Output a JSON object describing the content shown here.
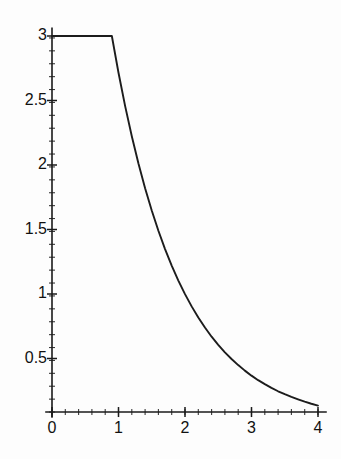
{
  "chart_data": {
    "type": "line",
    "title": "",
    "subtitle": "",
    "xlabel": "",
    "ylabel": "",
    "xlim": [
      -0.05,
      4.12
    ],
    "ylim": [
      0,
      3.12
    ],
    "grid": false,
    "legend": null,
    "annotations": [],
    "axis": {
      "x_ticks": [
        0,
        1,
        2,
        3,
        4
      ],
      "x_tick_labels": [
        "0",
        "1",
        "2",
        "3",
        "4"
      ],
      "x_minor_tick_step": 0.2,
      "y_ticks": [
        0.5,
        1,
        1.5,
        2,
        2.5,
        3
      ],
      "y_tick_labels": [
        "0.5",
        "1",
        "1.5",
        "2",
        "2.5",
        "3"
      ],
      "y_minor_tick_step": 0.1,
      "x_axis_position": 0.085,
      "line_color": "#1a1a1a"
    },
    "series": [
      {
        "name": "decay",
        "color": "#1c1c1c",
        "line_width": 1.9,
        "description": "constant 3 until x=0.9 then exponential decay 3*exp(-(x-0.9))",
        "x": [
          0,
          0.1,
          0.2,
          0.3,
          0.4,
          0.5,
          0.6,
          0.7,
          0.8,
          0.9,
          1.0,
          1.1,
          1.2,
          1.3,
          1.4,
          1.5,
          1.6,
          1.7,
          1.8,
          1.9,
          2.0,
          2.1,
          2.2,
          2.3,
          2.4,
          2.5,
          2.6,
          2.7,
          2.8,
          2.9,
          3.0,
          3.1,
          3.2,
          3.3,
          3.4,
          3.5,
          3.6,
          3.7,
          3.8,
          3.9,
          4.0
        ],
        "y": [
          3.0,
          3.0,
          3.0,
          3.0,
          3.0,
          3.0,
          3.0,
          3.0,
          3.0,
          3.0,
          2.715,
          2.456,
          2.223,
          2.011,
          1.82,
          1.647,
          1.49,
          1.348,
          1.22,
          1.104,
          0.999,
          0.904,
          0.818,
          0.74,
          0.669,
          0.606,
          0.548,
          0.496,
          0.449,
          0.406,
          0.367,
          0.332,
          0.301,
          0.272,
          0.246,
          0.223,
          0.202,
          0.183,
          0.165,
          0.149,
          0.135
        ]
      }
    ],
    "breakpoint": {
      "x": 0.9,
      "y": 3.0
    },
    "plateau_value": 3.0,
    "end_value": 0.135
  }
}
